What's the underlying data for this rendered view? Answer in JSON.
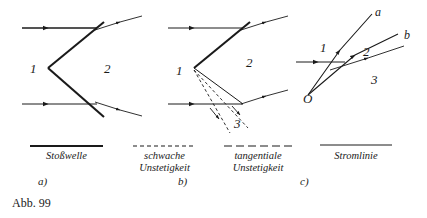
{
  "figure": {
    "caption": "Abb. 99",
    "panels": [
      {
        "id": "a",
        "sublabel": "a)",
        "region_labels": [
          {
            "text": "1",
            "x": 30,
            "y": 62
          },
          {
            "text": "2",
            "x": 104,
            "y": 62
          }
        ]
      },
      {
        "id": "b",
        "sublabel": "b)",
        "region_labels": [
          {
            "text": "1",
            "x": 176,
            "y": 64
          },
          {
            "text": "2",
            "x": 246,
            "y": 56
          },
          {
            "text": "3",
            "x": 234,
            "y": 117
          }
        ]
      },
      {
        "id": "c",
        "sublabel": "c)",
        "region_labels": [
          {
            "text": "1",
            "x": 320,
            "y": 41
          },
          {
            "text": "2",
            "x": 363,
            "y": 45
          },
          {
            "text": "3",
            "x": 371,
            "y": 73
          }
        ],
        "ray_labels": [
          {
            "text": "a",
            "x": 375,
            "y": 6
          },
          {
            "text": "b",
            "x": 404,
            "y": 29
          }
        ],
        "origin_label": {
          "text": "O",
          "x": 303,
          "y": 92
        }
      }
    ],
    "legend": [
      {
        "label": "Stoßwelle",
        "style": "thick-solid"
      },
      {
        "label": "schwache\nUnstetigkeit",
        "style": "short-dashed"
      },
      {
        "label": "tangentiale\nUnstetigkeit",
        "style": "long-dashed"
      },
      {
        "label": "Stromlinie",
        "style": "thin-solid"
      }
    ],
    "colors": {
      "ink": "#1a1a1a",
      "background": "#ffffff"
    }
  }
}
